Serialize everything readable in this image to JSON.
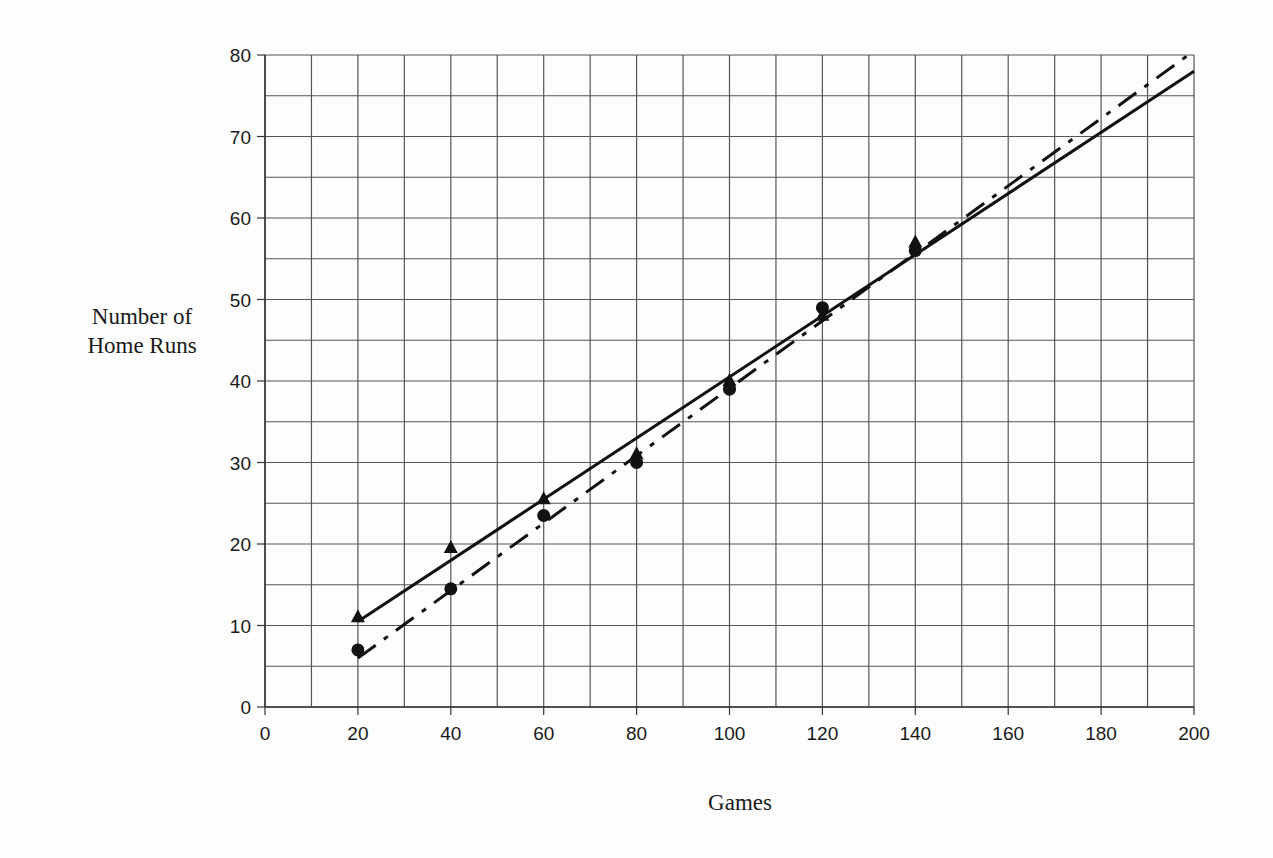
{
  "chart_data": {
    "type": "scatter",
    "title": "",
    "xlabel": "Games",
    "ylabel": "Number of Home Runs",
    "ylabel_lines": [
      "Number of",
      "Home Runs"
    ],
    "xlim": [
      0,
      200
    ],
    "ylim": [
      0,
      80
    ],
    "x_ticks": [
      0,
      20,
      40,
      60,
      80,
      100,
      120,
      140,
      160,
      180,
      200
    ],
    "y_ticks": [
      0,
      10,
      20,
      30,
      40,
      50,
      60,
      70,
      80
    ],
    "grid": {
      "on": true,
      "x_step": 10,
      "y_step": 5
    },
    "legend": null,
    "series": [
      {
        "name": "triangles",
        "marker": "triangle",
        "x": [
          20,
          40,
          60,
          80,
          100,
          120,
          140
        ],
        "values": [
          11,
          19.5,
          25.5,
          31,
          40,
          48,
          57
        ],
        "trendline": {
          "style": "solid",
          "x_start": 20,
          "y_start": 10.5,
          "x_end": 200,
          "y_end": 78
        }
      },
      {
        "name": "circles",
        "marker": "circle",
        "x": [
          20,
          40,
          60,
          80,
          100,
          120,
          140
        ],
        "values": [
          7,
          14.5,
          23.5,
          30,
          39,
          49,
          56
        ],
        "trendline": {
          "style": "dash-dot",
          "x_start": 20,
          "y_start": 6,
          "x_end": 200,
          "y_end": 80.5
        }
      }
    ],
    "colors": {
      "ink": "#111111",
      "grid": "#555555",
      "background": "#fdfdfd"
    }
  }
}
